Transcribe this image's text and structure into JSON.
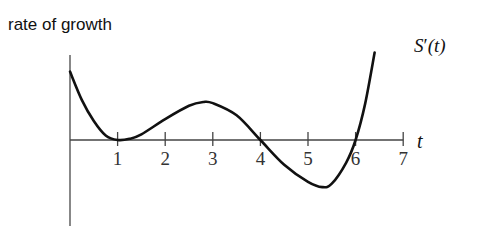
{
  "chart_data": {
    "type": "line",
    "title": "",
    "ylabel": "rate of growth",
    "xlabel": "t",
    "series": [
      {
        "name": "S'(t)",
        "label_parts": {
          "main": "S",
          "prime": "′",
          "arg": "(t)"
        },
        "x": [
          0,
          0.25,
          0.5,
          0.75,
          1.0,
          1.25,
          1.5,
          2.0,
          2.5,
          2.8,
          3.0,
          3.5,
          4.0,
          4.5,
          5.0,
          5.3,
          5.5,
          5.8,
          6.0,
          6.2,
          6.4
        ],
        "y": [
          1.8,
          1.05,
          0.5,
          0.12,
          0.0,
          0.03,
          0.15,
          0.55,
          0.9,
          1.0,
          0.97,
          0.65,
          0.0,
          -0.65,
          -1.1,
          -1.24,
          -1.15,
          -0.6,
          0.0,
          0.95,
          2.3
        ]
      }
    ],
    "x_ticks": [
      1,
      2,
      3,
      4,
      5,
      6,
      7
    ],
    "x_tick_labels": [
      "1",
      "2",
      "3",
      "4",
      "5",
      "6",
      "7"
    ],
    "xlim": [
      0,
      7
    ],
    "ylim": [
      -2.2,
      2.2
    ],
    "grid": false,
    "legend": "none"
  }
}
